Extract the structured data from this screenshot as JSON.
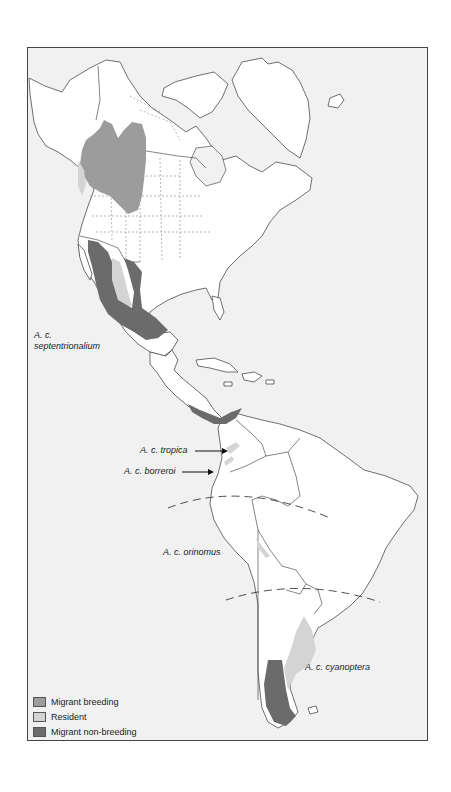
{
  "map": {
    "title": "",
    "region": "The Americas",
    "colors": {
      "background": "#f1f1f1",
      "land": "#ffffff",
      "migrant_breeding": "#9c9c9c",
      "resident": "#d4d4d4",
      "migrant_non_breeding": "#6b6b6b"
    },
    "subspecies_labels": [
      {
        "id": "septentrionalium",
        "line1": "A. c.",
        "line2": "septentrionalium"
      },
      {
        "id": "tropica",
        "text": "A. c. tropica"
      },
      {
        "id": "borreroi",
        "text": "A. c. borreroi"
      },
      {
        "id": "orinomus",
        "text": "A. c. orinomus"
      },
      {
        "id": "cyanoptera",
        "text": "A. c. cyanoptera"
      }
    ]
  },
  "legend": {
    "items": [
      {
        "label": "Migrant breeding",
        "color": "#9c9c9c"
      },
      {
        "label": "Resident",
        "color": "#d4d4d4"
      },
      {
        "label": "Migrant non-breeding",
        "color": "#6b6b6b"
      }
    ]
  }
}
